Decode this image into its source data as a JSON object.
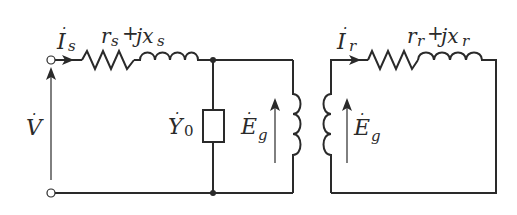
{
  "diagram": {
    "stator": {
      "current_label": {
        "main": "I",
        "sub": "s",
        "dot": "·"
      },
      "impedance_label": {
        "r": "r",
        "r_sub": "s",
        "plus": "+",
        "jx": "jx",
        "x_sub": "s"
      },
      "voltage_label": {
        "main": "V",
        "dot": "·"
      }
    },
    "magnetizing": {
      "admittance_label": {
        "main": "Y",
        "sub": "0",
        "dot": "·"
      },
      "emf_label": {
        "main": "E",
        "sub": "g",
        "dot": "·"
      }
    },
    "rotor": {
      "current_label": {
        "main": "I",
        "sub": "r",
        "dot": "·"
      },
      "impedance_label": {
        "r": "r",
        "r_sub": "r",
        "plus": "+",
        "jx": "jx",
        "x_sub": "r"
      },
      "emf_label": {
        "main": "E",
        "sub": "g",
        "dot": "·"
      }
    },
    "colors": {
      "line": "#2a2a2a",
      "background": "#ffffff"
    }
  }
}
